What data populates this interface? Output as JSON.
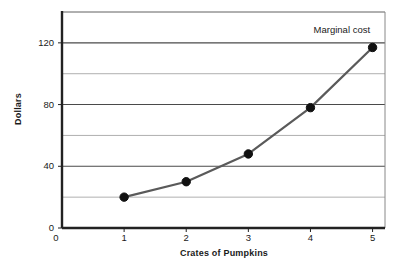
{
  "chart_data": {
    "type": "line",
    "title": "",
    "subtitle": "",
    "xlabel": "Crates of Pumpkins",
    "ylabel": "Dollars",
    "x": [
      1,
      2,
      3,
      4,
      5
    ],
    "series": [
      {
        "name": "Marginal cost",
        "values": [
          20,
          30,
          48,
          78,
          117
        ]
      }
    ],
    "xlim": [
      0,
      5.2
    ],
    "ylim": [
      0,
      140
    ],
    "xticks": [
      "0",
      "1",
      "2",
      "3",
      "4",
      "5"
    ],
    "xtick_values": [
      0,
      1,
      2,
      3,
      4,
      5
    ],
    "yticks": [
      "0",
      "40",
      "80",
      "120"
    ],
    "ytick_values": [
      0,
      40,
      80,
      120
    ],
    "gridlines_major": [
      40,
      80,
      120
    ],
    "gridlines_minor": [
      20,
      60,
      100,
      140
    ],
    "grid": "horizontal",
    "legend_position": "inline-annotation",
    "annotations": [
      {
        "text": "Marginal cost",
        "x": 5,
        "y": 128
      }
    ],
    "colors": {
      "line": "#5a5a5a",
      "marker": "#111111",
      "grid_major": "#4a4a4a",
      "grid_minor": "#9a9a9a",
      "axis": "#222222",
      "text": "#1a1a1a",
      "background": "#ffffff"
    }
  }
}
